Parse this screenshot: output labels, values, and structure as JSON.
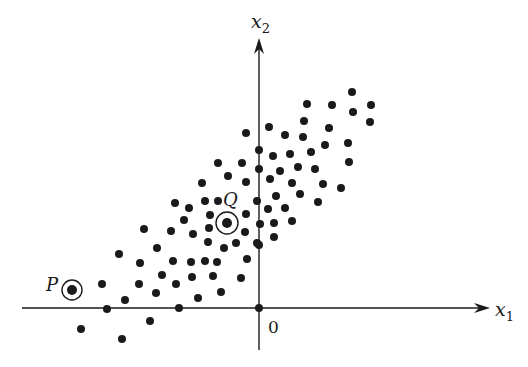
{
  "figure": {
    "width": 528,
    "height": 367,
    "ink_color": "#1a1a1a",
    "background": "#ffffff",
    "dot_radius": 4
  },
  "axes": {
    "origin": {
      "x": 259,
      "y": 308
    },
    "x_axis": {
      "x_start": 22,
      "x_end": 490,
      "y": 308,
      "label": "x",
      "subscript": "1",
      "label_x": 495,
      "label_y": 316
    },
    "y_axis": {
      "x": 259,
      "y_start": 350,
      "y_end": 38,
      "label": "x",
      "subscript": "2",
      "label_x": 251,
      "label_y": 28
    },
    "origin_label": {
      "text": "0",
      "x": 268,
      "y": 333
    }
  },
  "highlighted_points": [
    {
      "name": "P",
      "x": 72,
      "y": 290,
      "ring_radius": 10,
      "label_x": 46,
      "label_y": 291
    },
    {
      "name": "Q",
      "x": 227,
      "y": 223,
      "ring_radius": 11,
      "label_x": 223,
      "label_y": 206
    }
  ],
  "points": [
    [
      352,
      92
    ],
    [
      307,
      104
    ],
    [
      332,
      105
    ],
    [
      371,
      105
    ],
    [
      353,
      112
    ],
    [
      246,
      133
    ],
    [
      269,
      127
    ],
    [
      304,
      121
    ],
    [
      370,
      122
    ],
    [
      329,
      128
    ],
    [
      285,
      135
    ],
    [
      303,
      137
    ],
    [
      348,
      143
    ],
    [
      325,
      145
    ],
    [
      259,
      150
    ],
    [
      273,
      156
    ],
    [
      290,
      154
    ],
    [
      311,
      152
    ],
    [
      349,
      162
    ],
    [
      218,
      163
    ],
    [
      242,
      163
    ],
    [
      259,
      169
    ],
    [
      280,
      171
    ],
    [
      298,
      167
    ],
    [
      315,
      169
    ],
    [
      228,
      176
    ],
    [
      202,
      183
    ],
    [
      246,
      182
    ],
    [
      270,
      179
    ],
    [
      292,
      183
    ],
    [
      323,
      184
    ],
    [
      341,
      188
    ],
    [
      276,
      196
    ],
    [
      300,
      194
    ],
    [
      175,
      203
    ],
    [
      205,
      201
    ],
    [
      218,
      201
    ],
    [
      257,
      201
    ],
    [
      318,
      202
    ],
    [
      189,
      208
    ],
    [
      268,
      209
    ],
    [
      285,
      208
    ],
    [
      184,
      220
    ],
    [
      210,
      215
    ],
    [
      246,
      214
    ],
    [
      260,
      224
    ],
    [
      274,
      223
    ],
    [
      292,
      221
    ],
    [
      144,
      229
    ],
    [
      171,
      231
    ],
    [
      209,
      228
    ],
    [
      245,
      232
    ],
    [
      193,
      234
    ],
    [
      274,
      237
    ],
    [
      259,
      245
    ],
    [
      157,
      248
    ],
    [
      208,
      242
    ],
    [
      224,
      248
    ],
    [
      236,
      243
    ],
    [
      257,
      243
    ],
    [
      119,
      254
    ],
    [
      140,
      263
    ],
    [
      173,
      261
    ],
    [
      191,
      262
    ],
    [
      205,
      261
    ],
    [
      217,
      262
    ],
    [
      247,
      259
    ],
    [
      162,
      275
    ],
    [
      192,
      277
    ],
    [
      213,
      276
    ],
    [
      241,
      278
    ],
    [
      102,
      284
    ],
    [
      139,
      284
    ],
    [
      176,
      284
    ],
    [
      156,
      293
    ],
    [
      198,
      298
    ],
    [
      221,
      292
    ],
    [
      125,
      300
    ],
    [
      107,
      309
    ],
    [
      179,
      308
    ],
    [
      259,
      308
    ],
    [
      150,
      321
    ],
    [
      81,
      329
    ],
    [
      122,
      339
    ]
  ]
}
